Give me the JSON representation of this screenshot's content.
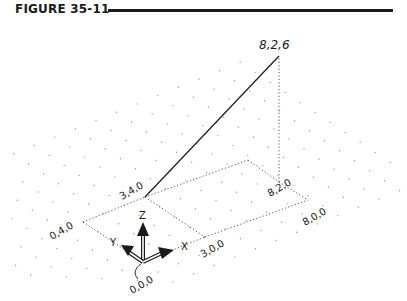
{
  "figure": {
    "title": "FIGURE 35-11"
  },
  "diagram": {
    "type": "isometric 3D line with UCS icon",
    "points": {
      "origin": {
        "label": "0,0,0",
        "xyz": [
          0,
          0,
          0
        ]
      },
      "p300": {
        "label": "3,0,0",
        "xyz": [
          3,
          0,
          0
        ]
      },
      "p040": {
        "label": "0,4,0",
        "xyz": [
          0,
          4,
          0
        ]
      },
      "p340": {
        "label": "3,4,0",
        "xyz": [
          3,
          4,
          0
        ]
      },
      "p800": {
        "label": "8,0,0",
        "xyz": [
          8,
          0,
          0
        ]
      },
      "p820": {
        "label": "8,2,0",
        "xyz": [
          8,
          2,
          0
        ]
      },
      "p826": {
        "label": "8,2,6",
        "xyz": [
          8,
          2,
          6
        ]
      }
    },
    "line": {
      "from": "3,4,0",
      "to": "8,2,6"
    },
    "ucs_icon": {
      "x_label": "X",
      "y_label": "Y",
      "z_label": "Z"
    },
    "colors": {
      "ink": "#1a1a1a",
      "grid_dot": "#9a9a9a",
      "background": "#ffffff"
    }
  }
}
